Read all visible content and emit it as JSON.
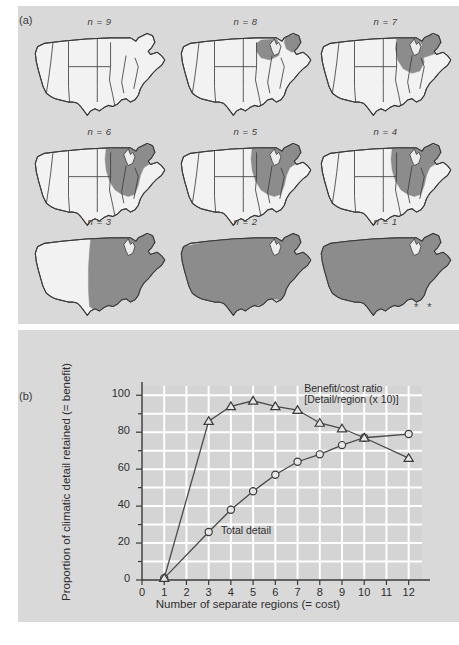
{
  "figure": {
    "panel_a_label": "(a)",
    "panel_b_label": "(b)",
    "asterisks": "* *",
    "background_color": "#d9d9d9",
    "region_fill_color": "#8c8c8c",
    "map_outline_color": "#3c3c3c"
  },
  "maps": [
    {
      "caption": "n = 9",
      "shaded": "none"
    },
    {
      "caption": "n = 8",
      "shaded": "great-lakes-and-new-england"
    },
    {
      "caption": "n = 7",
      "shaded": "upper-midwest-and-northeast"
    },
    {
      "caption": "n = 6",
      "shaded": "midwest-northeast-block"
    },
    {
      "caption": "n = 5",
      "shaded": "midwest-northeast-block"
    },
    {
      "caption": "n = 4",
      "shaded": "midwest-northeast-block"
    },
    {
      "caption": "n = 3",
      "shaded": "eastern-two-thirds"
    },
    {
      "caption": "n = 2",
      "shaded": "all-but-southeast"
    },
    {
      "caption": "n = 1",
      "shaded": "entire-country"
    }
  ],
  "chart_data": {
    "type": "line",
    "title": "",
    "xlabel": "Number of separate regions (= cost)",
    "ylabel": "Proportion of climatic detail retained (= benefit)",
    "xlim": [
      0,
      12.6
    ],
    "ylim": [
      0,
      105
    ],
    "xticks": [
      0,
      1,
      2,
      3,
      4,
      5,
      6,
      7,
      8,
      9,
      10,
      11,
      12
    ],
    "yticks": [
      0,
      20,
      40,
      60,
      80,
      100
    ],
    "grid": true,
    "grid_color": "#ffffff",
    "legend_position": "in-plot-annotations",
    "x": [
      1,
      3,
      4,
      5,
      6,
      7,
      8,
      9,
      10,
      12
    ],
    "series": [
      {
        "name": "Total detail",
        "marker": "circle",
        "label": "Total detail",
        "values": [
          1,
          26,
          38,
          48,
          57,
          64,
          68,
          73,
          77,
          79
        ]
      },
      {
        "name": "Benefit/cost ratio",
        "marker": "triangle",
        "label": "Benefit/cost ratio",
        "label_line2": "[Detail/region (x 10)]",
        "values": [
          1,
          86,
          94,
          97,
          94,
          92,
          85,
          82,
          77,
          66
        ]
      }
    ],
    "annotations": [
      {
        "text": "Benefit/cost ratio",
        "x": 7.3,
        "y": 103
      },
      {
        "text": "[Detail/region (x 10)]",
        "x": 7.3,
        "y": 97
      },
      {
        "text": "Total detail",
        "x": 3.55,
        "y": 26
      }
    ]
  }
}
